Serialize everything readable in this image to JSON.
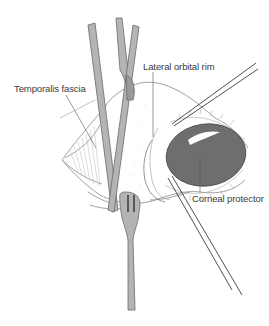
{
  "figure": {
    "type": "surgical illustration",
    "labels": {
      "temporalis_fascia": "Temporalis fascia",
      "lateral_orbital_rim": "Lateral orbital rim",
      "corneal_protector": "Corneal protector"
    },
    "colors": {
      "instrument_fill": "#b4b4b4",
      "instrument_stroke": "#6a6a6a",
      "corneal_protector_fill": "#6e6e6e",
      "line": "#555555",
      "background": "#ffffff"
    }
  }
}
